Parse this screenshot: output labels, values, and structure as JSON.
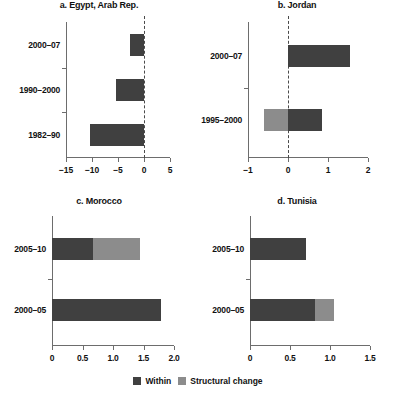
{
  "chart_data": {
    "type": "bar",
    "title": "",
    "orientation": "horizontal",
    "stacked": true,
    "grid": false,
    "legend_position": "bottom",
    "legend": [
      {
        "name": "Within",
        "color": "#404040"
      },
      {
        "name": "Structural change",
        "color": "#8c8c8c"
      }
    ],
    "panels": [
      {
        "id": "egypt",
        "title": "a. Egypt, Arab Rep.",
        "categories": [
          "2000–07",
          "1990–2000",
          "1982–90"
        ],
        "series": [
          {
            "name": "Within",
            "values": [
              -2.6,
              -5.3,
              -10.4
            ]
          },
          {
            "name": "Structural change",
            "values": [
              0.0,
              0.0,
              0.0
            ]
          }
        ],
        "xlim": [
          -15,
          5
        ],
        "xticks": [
          -15,
          -10,
          -5,
          0,
          5
        ],
        "xticklabels": [
          "−15",
          "−10",
          "−5",
          "0",
          "5"
        ],
        "xlabel": "",
        "ylabel": ""
      },
      {
        "id": "jordan",
        "title": "b. Jordan",
        "categories": [
          "2000–07",
          "1995–2000"
        ],
        "series": [
          {
            "name": "Within",
            "values": [
              1.55,
              0.85
            ]
          },
          {
            "name": "Structural change",
            "values": [
              0.0,
              -0.6
            ]
          }
        ],
        "xlim": [
          -1,
          2
        ],
        "xticks": [
          -1,
          0,
          1,
          2
        ],
        "xticklabels": [
          "−1",
          "0",
          "1",
          "2"
        ],
        "xlabel": "",
        "ylabel": ""
      },
      {
        "id": "morocco",
        "title": "c. Morocco",
        "categories": [
          "2005–10",
          "2000–05"
        ],
        "series": [
          {
            "name": "Within",
            "values": [
              0.67,
              1.78
            ]
          },
          {
            "name": "Structural change",
            "values": [
              0.78,
              0.0
            ]
          }
        ],
        "xlim": [
          0,
          2.0
        ],
        "xticks": [
          0,
          0.5,
          1.0,
          1.5,
          2.0
        ],
        "xticklabels": [
          "0",
          "0.5",
          "1.0",
          "1.5",
          "2.0"
        ],
        "xlabel": "",
        "ylabel": ""
      },
      {
        "id": "tunisia",
        "title": "d. Tunisia",
        "categories": [
          "2005–10",
          "2000–05"
        ],
        "series": [
          {
            "name": "Within",
            "values": [
              0.7,
              0.81
            ]
          },
          {
            "name": "Structural change",
            "values": [
              0.0,
              0.24
            ]
          }
        ],
        "xlim": [
          0,
          1.5
        ],
        "xticks": [
          0,
          0.5,
          1.0,
          1.5
        ],
        "xticklabels": [
          "0",
          "0.5",
          "1.0",
          "1.5"
        ],
        "xlabel": "",
        "ylabel": ""
      }
    ]
  },
  "colors": {
    "within": "#404040",
    "structural_change": "#8c8c8c",
    "axis": "#6d6d6d",
    "zero_line": "#4a4a4a",
    "background": "#ffffff"
  }
}
